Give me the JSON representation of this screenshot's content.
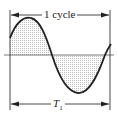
{
  "diagram": {
    "type": "sine-wave-period",
    "top_label": "1 cycle",
    "bottom_label_main": "T",
    "bottom_label_sub": "1",
    "colors": {
      "line": "#222222",
      "axis": "#555555",
      "fill": "#d8d8d8",
      "background": "#ffffff"
    }
  }
}
